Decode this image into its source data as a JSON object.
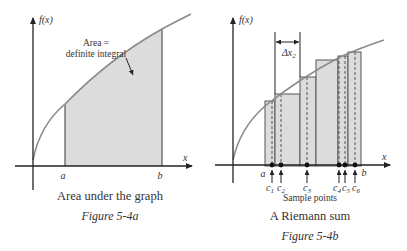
{
  "figure_a": {
    "axis_y_label": "f(x)",
    "axis_x_label": "x",
    "annotation_line1": "Area =",
    "annotation_line2": "definite integral",
    "tick_a": "a",
    "tick_b": "b",
    "caption": "Area under the graph",
    "figure_label": "Figure 5-4a"
  },
  "figure_b": {
    "axis_y_label": "f(x)",
    "axis_x_label": "x",
    "delta_label": "Δx",
    "delta_sub": "2",
    "tick_a": "a",
    "tick_b": "b",
    "sample_points": [
      {
        "label": "c",
        "sub": "1"
      },
      {
        "label": "c",
        "sub": "2"
      },
      {
        "label": "c",
        "sub": "3"
      },
      {
        "label": "c",
        "sub": "4"
      },
      {
        "label": "c",
        "sub": "5"
      },
      {
        "label": "c",
        "sub": "6"
      }
    ],
    "sample_caption": "Sample points",
    "caption": "A Riemann sum",
    "figure_label": "Figure 5-4b"
  },
  "colors": {
    "axis": "#222222",
    "curve": "#8a8a8a",
    "shade": "#dcdcdc",
    "bar_edge": "#555555",
    "text": "#333333"
  }
}
